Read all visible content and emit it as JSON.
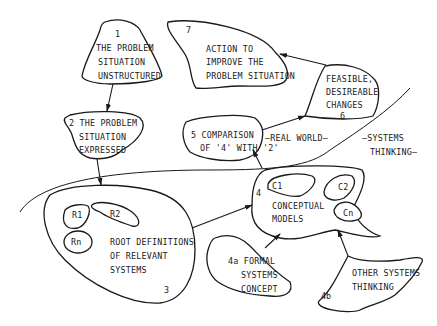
{
  "nodes": {
    "n1": {
      "number": "1",
      "lines": [
        "THE PROBLEM",
        "SITUATION",
        "UNSTRUCTURED"
      ]
    },
    "n2": {
      "lines": [
        "2 THE PROBLEM",
        "SITUATION",
        "EXPRESSED"
      ]
    },
    "n3": {
      "number": "3",
      "lines": [
        "ROOT DEFINITIONS",
        "OF RELEVANT",
        "SYSTEMS"
      ],
      "subs": [
        "R1",
        "R2",
        "Rn"
      ]
    },
    "n4": {
      "number": "4",
      "lines": [
        "CONCEPTUAL",
        "MODELS"
      ],
      "subs": [
        "C1",
        "C2",
        "Cn"
      ]
    },
    "n4a": {
      "lines": [
        "4a FORMAL",
        "SYSTEMS",
        "CONCEPT"
      ]
    },
    "n4b": {
      "number": "4b",
      "lines": [
        "OTHER SYSTEMS",
        "THINKING"
      ]
    },
    "n5": {
      "lines": [
        "5 COMPARISON",
        "OF '4' WITH '2'"
      ]
    },
    "n6": {
      "number": "6",
      "lines": [
        "FEASIBLE,",
        "DESIREABLE",
        "CHANGES"
      ]
    },
    "n7": {
      "number": "7",
      "lines": [
        "ACTION TO",
        "IMPROVE THE",
        "PROBLEM SITUATION"
      ]
    }
  },
  "regions": {
    "real_world": "—REAL WORLD—",
    "systems_thinking_1": "—SYSTEMS",
    "systems_thinking_2": "THINKING—"
  },
  "edges": [
    {
      "from": "1",
      "to": "2"
    },
    {
      "from": "2",
      "to": "3"
    },
    {
      "from": "3",
      "to": "4"
    },
    {
      "from": "4a",
      "to": "4"
    },
    {
      "from": "4b",
      "to": "4"
    },
    {
      "from": "4",
      "to": "5"
    },
    {
      "from": "5",
      "to": "6"
    },
    {
      "from": "6",
      "to": "7"
    }
  ]
}
